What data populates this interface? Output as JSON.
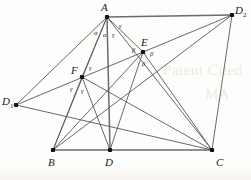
{
  "figure": {
    "kind": "geometry-diagram",
    "width": 251,
    "height": 180,
    "background_color": "#fdfdfc",
    "line_color": "#585858",
    "vertex_color": "#111111"
  },
  "watermarks": [
    {
      "text": "Patent Cited",
      "x": 163,
      "y": 62
    },
    {
      "text": "MA",
      "x": 205,
      "y": 86
    }
  ],
  "vertices": [
    {
      "id": "A",
      "label": "A",
      "sub": "",
      "x": 107,
      "y": 17,
      "label_x": 101,
      "label_y": 2
    },
    {
      "id": "D2",
      "label": "D",
      "sub": "2",
      "x": 232,
      "y": 15,
      "label_x": 235,
      "label_y": 5
    },
    {
      "id": "E",
      "label": "E",
      "sub": "",
      "x": 143,
      "y": 52,
      "label_x": 141,
      "label_y": 37
    },
    {
      "id": "F",
      "label": "F",
      "sub": "",
      "x": 82,
      "y": 77,
      "label_x": 71,
      "label_y": 65
    },
    {
      "id": "D1",
      "label": "D",
      "sub": "1",
      "x": 16,
      "y": 105,
      "label_x": 2,
      "label_y": 96
    },
    {
      "id": "B",
      "label": "B",
      "sub": "",
      "x": 53,
      "y": 150,
      "label_x": 48,
      "label_y": 157
    },
    {
      "id": "D",
      "label": "D",
      "sub": "",
      "x": 110,
      "y": 150,
      "label_x": 105,
      "label_y": 157
    },
    {
      "id": "C",
      "label": "C",
      "sub": "",
      "x": 212,
      "y": 150,
      "label_x": 216,
      "label_y": 157
    }
  ],
  "edges": [
    {
      "name": "edge-A-D2",
      "from": "A",
      "to": "D2",
      "thick": true
    },
    {
      "name": "edge-B-C",
      "from": "B",
      "to": "C",
      "thick": true
    },
    {
      "name": "edge-A-D",
      "from": "A",
      "to": "D",
      "thick": true
    },
    {
      "name": "edge-A-D1",
      "from": "A",
      "to": "D1",
      "thick": false
    },
    {
      "name": "edge-A-B",
      "from": "A",
      "to": "B",
      "thick": false
    },
    {
      "name": "edge-A-F",
      "from": "A",
      "to": "F",
      "thick": false
    },
    {
      "name": "edge-A-E",
      "from": "A",
      "to": "E",
      "thick": false
    },
    {
      "name": "edge-A-C",
      "from": "A",
      "to": "C",
      "thick": false
    },
    {
      "name": "edge-D1-E",
      "from": "D1",
      "to": "D2",
      "thick": false
    },
    {
      "name": "edge-D1-C",
      "from": "D1",
      "to": "C",
      "thick": false
    },
    {
      "name": "edge-F-D",
      "from": "F",
      "to": "D",
      "thick": false
    },
    {
      "name": "edge-F-B",
      "from": "F",
      "to": "B",
      "thick": false
    },
    {
      "name": "edge-F-C",
      "from": "F",
      "to": "C",
      "thick": false
    },
    {
      "name": "edge-E-B",
      "from": "E",
      "to": "B",
      "thick": false
    },
    {
      "name": "edge-E-D",
      "from": "E",
      "to": "D",
      "thick": false
    },
    {
      "name": "edge-E-C",
      "from": "E",
      "to": "C",
      "thick": false
    },
    {
      "name": "edge-D2-C",
      "from": "D2",
      "to": "C",
      "thick": false
    },
    {
      "name": "edge-D2-B",
      "from": "D2",
      "to": "B",
      "thick": false
    }
  ],
  "angle_labels": [
    {
      "name": "angle-alpha-left",
      "text": "α",
      "x": 94,
      "y": 30
    },
    {
      "name": "angle-alpha-right",
      "text": "α",
      "x": 103,
      "y": 32
    },
    {
      "name": "angle-gamma-apex",
      "text": "γ",
      "x": 112,
      "y": 32
    },
    {
      "name": "angle-gamma-apex2",
      "text": "γ",
      "x": 119,
      "y": 23
    },
    {
      "name": "angle-beta-E-left",
      "text": "β",
      "x": 132,
      "y": 47
    },
    {
      "name": "angle-beta-E-right",
      "text": "β",
      "x": 150,
      "y": 51
    },
    {
      "name": "angle-beta-E-low",
      "text": "β",
      "x": 142,
      "y": 61
    },
    {
      "name": "angle-gamma-F-up",
      "text": "γ",
      "x": 89,
      "y": 65
    },
    {
      "name": "angle-gamma-F-left",
      "text": "γ",
      "x": 70,
      "y": 86
    },
    {
      "name": "angle-gamma-F-low",
      "text": "γ",
      "x": 81,
      "y": 88
    }
  ]
}
